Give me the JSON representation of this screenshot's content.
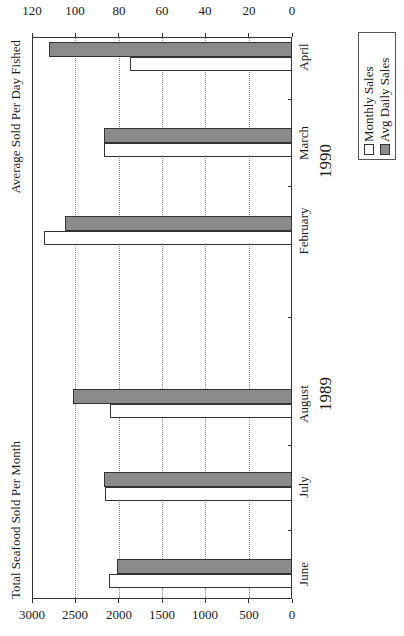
{
  "chart_data": {
    "type": "bar",
    "orientation_note": "rendered rotated 90deg counter-clockwise",
    "title": "",
    "left_axis_title": "Total Seafood Sold Per Month",
    "right_axis_title": "Average Sold Per Day Fished",
    "categories": [
      "June",
      "July",
      "August",
      "February",
      "March",
      "April"
    ],
    "category_groups": [
      {
        "label": "1989",
        "categories": [
          "June",
          "July",
          "August"
        ]
      },
      {
        "label": "1990",
        "categories": [
          "February",
          "March",
          "April"
        ]
      }
    ],
    "series": [
      {
        "name": "Monthly Sales",
        "axis": "left",
        "fill": "white",
        "values": [
          2110,
          2160,
          2100,
          2860,
          2170,
          1870
        ]
      },
      {
        "name": "Avg Daily Sales",
        "axis": "right",
        "fill": "stippled gray",
        "values": [
          81,
          87,
          101,
          105,
          87,
          112
        ]
      }
    ],
    "left_axis": {
      "min": 0,
      "max": 3000,
      "ticks": [
        "0",
        "500",
        "1000",
        "1500",
        "2000",
        "2500",
        "3000"
      ]
    },
    "right_axis": {
      "min": 0,
      "max": 120,
      "ticks": [
        "0",
        "20",
        "40",
        "60",
        "80",
        "100",
        "120"
      ]
    },
    "grid": "dotted horizontal gridlines",
    "legend": {
      "position": "bottom-right",
      "entries": [
        "Monthly Sales",
        "Avg Daily Sales"
      ]
    }
  },
  "labels": {
    "left_axis_title": "Total Seafood Sold Per Month",
    "right_axis_title": "Average Sold Per Day Fished",
    "year_1989": "1989",
    "year_1990": "1990",
    "legend_monthly": "Monthly Sales",
    "legend_avg": "Avg Daily Sales",
    "cats": [
      "June",
      "July",
      "August",
      "February",
      "March",
      "April"
    ],
    "left_ticks": [
      "0",
      "500",
      "1000",
      "1500",
      "2000",
      "2500",
      "3000"
    ],
    "right_ticks": [
      "0",
      "20",
      "40",
      "60",
      "80",
      "100",
      "120"
    ]
  },
  "colors": {
    "avg_fill": "#bdbdbd",
    "monthly_fill": "#ffffff",
    "frame": "#333333"
  }
}
